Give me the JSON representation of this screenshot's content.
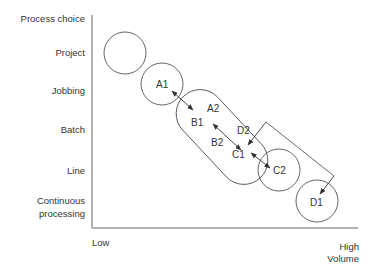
{
  "diagram": {
    "y_axis_title": "Process choice",
    "y_categories": [
      "Project",
      "Jobbing",
      "Batch",
      "Line",
      "Continuous processing"
    ],
    "y_categories_lines": {
      "continuous_1": "Continuous",
      "continuous_2": "processing"
    },
    "x_axis": {
      "low_label": "Low",
      "high_label_1": "High",
      "high_label_2": "Volume"
    },
    "nodes": {
      "a1": "A1",
      "a2": "A2",
      "b1": "B1",
      "b2": "B2",
      "c1": "C1",
      "c2": "C2",
      "d1": "D1",
      "d2": "D2"
    },
    "colors": {
      "line": "#555555",
      "text": "#333333",
      "background": "#ffffff"
    }
  }
}
